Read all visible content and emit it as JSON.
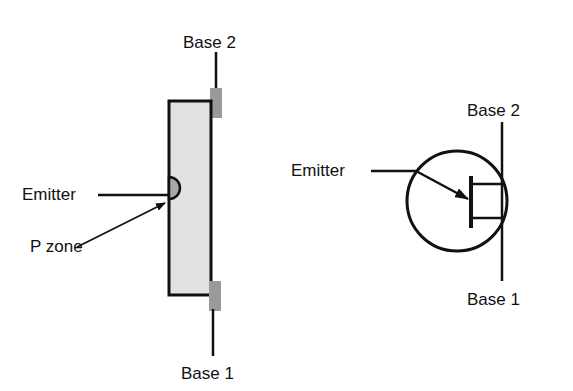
{
  "diagram": {
    "left": {
      "labels": {
        "base2": "Base 2",
        "base1": "Base 1",
        "emitter": "Emitter",
        "pzone": "P zone"
      }
    },
    "right": {
      "labels": {
        "base2": "Base 2",
        "base1": "Base 1",
        "emitter": "Emitter"
      }
    },
    "colors": {
      "line": "#111111",
      "bar_fill": "#e2e2e2",
      "tab_fill": "#9a9a9a",
      "pzone_fill": "#a8a8a8",
      "background": "#ffffff"
    }
  }
}
